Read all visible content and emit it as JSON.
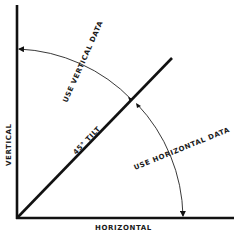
{
  "diagram": {
    "axes": {
      "vertical_label": "VERTICAL",
      "horizontal_label": "HORIZONTAL"
    },
    "tilt_line_label": "45° TILT",
    "regions": {
      "upper_label": "USE VERTICAL DATA",
      "lower_label": "USE HORIZONTAL DATA"
    },
    "colors": {
      "line": "#111111",
      "background": "#ffffff"
    }
  }
}
